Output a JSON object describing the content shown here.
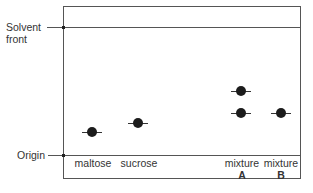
{
  "diagram": {
    "type": "paper chromatogram",
    "labels": {
      "solvent_front_line1": "Solvent",
      "solvent_front_line2": "front",
      "origin": "Origin"
    },
    "lanes": [
      {
        "name": "maltose",
        "sub": ""
      },
      {
        "name": "sucrose",
        "sub": ""
      },
      {
        "name": "mixture",
        "sub": "A"
      },
      {
        "name": "mixture",
        "sub": "B"
      }
    ],
    "spots": [
      {
        "lane": "maltose",
        "x": 92,
        "y": 132
      },
      {
        "lane": "sucrose",
        "x": 138,
        "y": 123
      },
      {
        "lane": "mixture A",
        "x": 241,
        "y": 91
      },
      {
        "lane": "mixture A",
        "x": 241,
        "y": 113
      },
      {
        "lane": "mixture B",
        "x": 281,
        "y": 113
      }
    ]
  }
}
